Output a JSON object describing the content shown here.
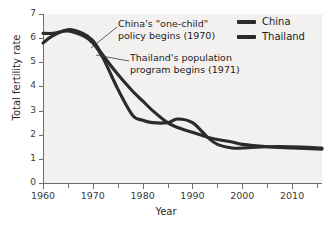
{
  "chart_data": {
    "type": "line",
    "title": "",
    "xlabel": "Year",
    "ylabel": "Total fertility rate",
    "xlim": [
      1960,
      2016
    ],
    "ylim": [
      0,
      7
    ],
    "xticks": [
      1960,
      1970,
      1980,
      1990,
      2000,
      2010
    ],
    "xtick_labels": [
      "1960",
      "1970",
      "1980",
      "1990",
      "2000",
      "2010"
    ],
    "xminor_ticks": [
      1965,
      1975,
      1985,
      1995,
      2005,
      2015
    ],
    "yticks": [
      0,
      1,
      2,
      3,
      4,
      5,
      6,
      7
    ],
    "ytick_labels": [
      "0",
      "1",
      "2",
      "3",
      "4",
      "5",
      "6",
      "7"
    ],
    "grid": false,
    "legend_position": "top-right",
    "x": [
      1960,
      1962,
      1965,
      1968,
      1970,
      1972,
      1975,
      1978,
      1980,
      1982,
      1985,
      1987,
      1990,
      1993,
      1995,
      1998,
      2000,
      2005,
      2010,
      2016
    ],
    "series": [
      {
        "name": "China",
        "color": "#2b2b2b",
        "values": [
          6.2,
          6.2,
          6.3,
          6.1,
          5.8,
          5.2,
          3.9,
          2.8,
          2.6,
          2.5,
          2.5,
          2.65,
          2.5,
          1.9,
          1.6,
          1.45,
          1.45,
          1.5,
          1.5,
          1.45
        ]
      },
      {
        "name": "Thailand",
        "color": "#2b2b2b",
        "values": [
          5.8,
          6.1,
          6.35,
          6.2,
          5.9,
          5.3,
          4.5,
          3.8,
          3.4,
          3.0,
          2.5,
          2.3,
          2.1,
          1.9,
          1.8,
          1.7,
          1.6,
          1.5,
          1.45,
          1.4
        ]
      }
    ],
    "annotations": [
      {
        "name": "china-policy",
        "line1": "China's \"one-child\"",
        "line2": "policy begins (1970)",
        "target_year": 1970
      },
      {
        "name": "thailand-program",
        "line1": "Thailand's population",
        "line2": "program begins (1971)",
        "target_year": 1971
      }
    ]
  },
  "legend": {
    "items": [
      {
        "label": "China",
        "color": "#2b2b2b"
      },
      {
        "label": "Thailand",
        "color": "#2b2b2b"
      }
    ]
  },
  "axes": {
    "x_title": "Year",
    "y_title": "Total fertility rate"
  }
}
